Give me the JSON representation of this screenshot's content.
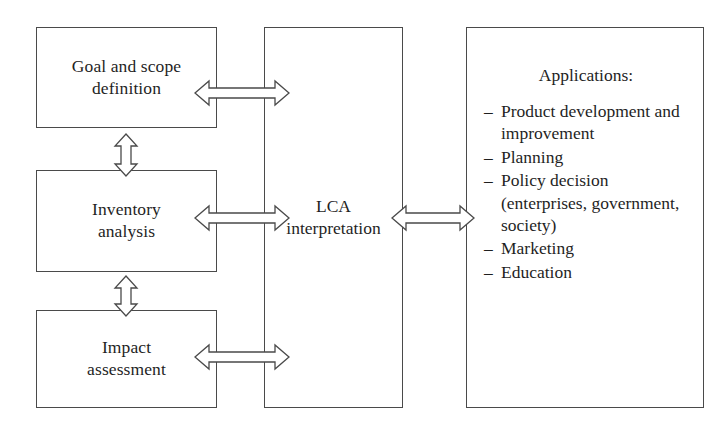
{
  "diagram": {
    "stages": [
      {
        "id": "goal-scope",
        "label": "Goal and scope\ndefinition"
      },
      {
        "id": "inventory-analysis",
        "label": "Inventory\nanalysis"
      },
      {
        "id": "impact-assessment",
        "label": "Impact\nassessment"
      }
    ],
    "interpretation": {
      "id": "lca-interpretation",
      "label": "LCA\ninterpretation"
    },
    "applications": {
      "id": "applications",
      "title": "Applications:",
      "bullet": "–",
      "items": [
        "Product development and improvement",
        "Planning",
        "Policy decision (enterprises, government, society)",
        "Marketing",
        "Education"
      ]
    },
    "connectors": [
      {
        "id": "goal-to-interpretation",
        "type": "double-arrow-horizontal"
      },
      {
        "id": "inventory-to-interpretation",
        "type": "double-arrow-horizontal"
      },
      {
        "id": "impact-to-interpretation",
        "type": "double-arrow-horizontal"
      },
      {
        "id": "goal-to-inventory",
        "type": "double-arrow-vertical"
      },
      {
        "id": "inventory-to-impact",
        "type": "double-arrow-vertical"
      },
      {
        "id": "interpretation-to-applications",
        "type": "double-arrow-horizontal"
      }
    ],
    "colors": {
      "stroke": "#4a4a4a",
      "text": "#1f1f1f",
      "background": "#ffffff"
    }
  }
}
